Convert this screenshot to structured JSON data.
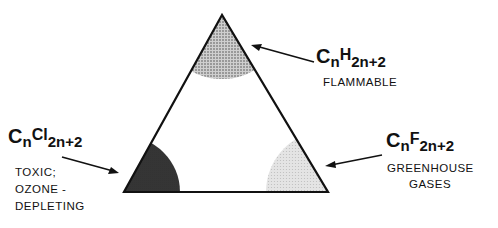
{
  "diagram": {
    "type": "ternary-triangle",
    "vertices": {
      "top": {
        "formula_base": "C",
        "formula_sub1": "n",
        "formula_mid": "H",
        "formula_sub2": "2n+2",
        "formula": "CnH2n+2",
        "property": "FLAMMABLE"
      },
      "bottom_left": {
        "formula_base": "C",
        "formula_sub1": "n",
        "formula_mid": "Cl",
        "formula_sub2": "2n+2",
        "formula": "CnCl2n+2",
        "property_line1": "TOXIC;",
        "property_line2": "OZONE -",
        "property_line3": "DEPLETING"
      },
      "bottom_right": {
        "formula_base": "C",
        "formula_sub1": "n",
        "formula_mid": "F",
        "formula_sub2": "2n+2",
        "formula": "CnF2n+2",
        "property_line1": "GREENHOUSE",
        "property_line2": "GASES"
      }
    },
    "colors": {
      "outline": "#111111",
      "flammable_shade": "#9a9a9a",
      "toxic_shade": "#3a3a3a",
      "greenhouse_shade": "#d6d6d6"
    }
  }
}
